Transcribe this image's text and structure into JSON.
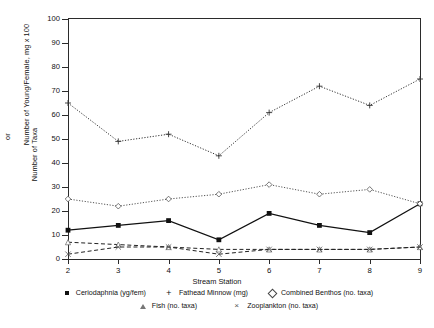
{
  "chart_data": {
    "type": "line",
    "title": "",
    "xlabel": "Stream Station",
    "ylabel": "Number of Young/Female, mg x 100 or Number of Taxa",
    "ylabel_line1": "Number of Young/Female, mg x 100",
    "ylabel_line2": "or",
    "ylabel_line3": "Number of Taxa",
    "x": [
      2,
      3,
      4,
      5,
      6,
      7,
      8,
      9
    ],
    "xticklabels": [
      "2",
      "3",
      "4",
      "5",
      "6",
      "7",
      "8",
      "9"
    ],
    "yticklabels": [
      "0",
      "10",
      "20",
      "30",
      "40",
      "50",
      "60",
      "70",
      "80",
      "90",
      "100"
    ],
    "yticks": [
      0,
      10,
      20,
      30,
      40,
      50,
      60,
      70,
      80,
      90,
      100
    ],
    "xlim": [
      2,
      9
    ],
    "ylim": [
      0,
      100
    ],
    "grid": false,
    "legend_position": "below",
    "series": [
      {
        "name": "Ceriodaphnia (yg/fem)",
        "marker": "square",
        "linestyle": "solid",
        "color": "#111111",
        "values": [
          12,
          14,
          16,
          8,
          19,
          14,
          11,
          23
        ]
      },
      {
        "name": "Fathead Minnow (mg)",
        "marker": "plus",
        "linestyle": "dotted",
        "color": "#333333",
        "values": [
          65,
          49,
          52,
          43,
          61,
          72,
          64,
          75
        ]
      },
      {
        "name": "Combined Benthos (no. taxa)",
        "marker": "diamond",
        "linestyle": "dotted",
        "color": "#555555",
        "values": [
          25,
          22,
          25,
          27,
          31,
          27,
          29,
          23
        ]
      },
      {
        "name": "Fish (no. taxa)",
        "marker": "triangle",
        "linestyle": "dashed",
        "color": "#222222",
        "values": [
          7,
          6,
          5,
          4,
          4,
          4,
          4,
          5
        ]
      },
      {
        "name": "Zooplankton (no. taxa)",
        "marker": "x",
        "linestyle": "dashed",
        "color": "#222222",
        "values": [
          2,
          5,
          5,
          2,
          4,
          4,
          4,
          5
        ]
      }
    ]
  },
  "legend": {
    "row1": [
      "Ceriodaphnia (yg/fem)",
      "Fathead Minnow (mg)",
      "Combined Benthos (no. taxa)"
    ],
    "row2": [
      "Fish (no. taxa)",
      "Zooplankton (no. taxa)"
    ]
  }
}
